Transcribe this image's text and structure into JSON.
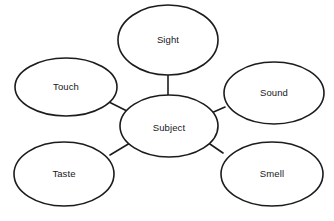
{
  "diagram": {
    "type": "spider-web-concept-map",
    "background_color": "#ffffff",
    "stroke_color": "#1c1c1c",
    "text_color": "#17181a",
    "center": {
      "id": "subject",
      "label": "Subject",
      "cx": 169,
      "cy": 126,
      "rx": 49,
      "ry": 31,
      "label_x": 169,
      "label_y": 128
    },
    "nodes": [
      {
        "id": "sight",
        "label": "Sight",
        "cx": 168,
        "cy": 40,
        "rx": 50,
        "ry": 35,
        "label_x": 168,
        "label_y": 40
      },
      {
        "id": "touch",
        "label": "Touch",
        "cx": 66,
        "cy": 87,
        "rx": 51,
        "ry": 29,
        "label_x": 66,
        "label_y": 87
      },
      {
        "id": "sound",
        "label": "Sound",
        "cx": 274,
        "cy": 93,
        "rx": 50,
        "ry": 31,
        "label_x": 274,
        "label_y": 93
      },
      {
        "id": "taste",
        "label": "Taste",
        "cx": 64,
        "cy": 174,
        "rx": 50,
        "ry": 32,
        "label_x": 64,
        "label_y": 174
      },
      {
        "id": "smell",
        "label": "Smell",
        "cx": 272,
        "cy": 174,
        "rx": 51,
        "ry": 32,
        "label_x": 272,
        "label_y": 174
      }
    ],
    "connectors": [
      {
        "id": "sight-subject",
        "from": "sight",
        "to": "subject",
        "x1": 168,
        "y1": 74,
        "x2": 168,
        "y2": 96
      },
      {
        "id": "touch-subject",
        "from": "touch",
        "to": "subject",
        "x1": 109,
        "y1": 102,
        "x2": 129,
        "y2": 112
      },
      {
        "id": "sound-subject",
        "from": "sound",
        "to": "subject",
        "x1": 225,
        "y1": 107,
        "x2": 209,
        "y2": 114
      },
      {
        "id": "taste-subject",
        "from": "taste",
        "to": "subject",
        "x1": 110,
        "y1": 155,
        "x2": 130,
        "y2": 143
      },
      {
        "id": "smell-subject",
        "from": "smell",
        "to": "subject",
        "x1": 223,
        "y1": 153,
        "x2": 207,
        "y2": 142
      }
    ]
  }
}
